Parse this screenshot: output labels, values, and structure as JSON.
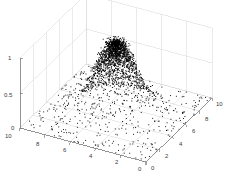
{
  "figure": {
    "background_color": "#ffffff",
    "grid_color": "#d5d5d5",
    "axis_color": "#7d7d7d",
    "marker_color": "#000000",
    "tick_label_color": "#3a3a3a"
  },
  "chart_data": {
    "type": "scatter",
    "title": "",
    "xlabel": "",
    "ylabel": "",
    "zlabel": "",
    "projection": "3d",
    "grid": true,
    "legend": null,
    "xlim": [
      0,
      10
    ],
    "ylim": [
      0,
      10
    ],
    "zlim": [
      0,
      1
    ],
    "xticks": [
      10,
      8,
      6,
      4,
      2,
      0
    ],
    "yticks": [
      0,
      2,
      4,
      6,
      8,
      10
    ],
    "zticks": [
      0,
      0.5,
      1
    ],
    "xtick_labels": [
      "10",
      "8",
      "6",
      "4",
      "2",
      "0"
    ],
    "ytick_labels": [
      "0",
      "2",
      "4",
      "6",
      "8",
      "10"
    ],
    "ztick_labels": [
      "0",
      "0.5",
      "1"
    ],
    "peak": {
      "x": 5,
      "y": 5,
      "z": 1
    },
    "point_count": 2400,
    "marker": "dot",
    "marker_size": 1
  },
  "axes": {
    "z_axis_name": "z-axis",
    "x_axis_name": "x-axis",
    "y_axis_name": "y-axis"
  }
}
